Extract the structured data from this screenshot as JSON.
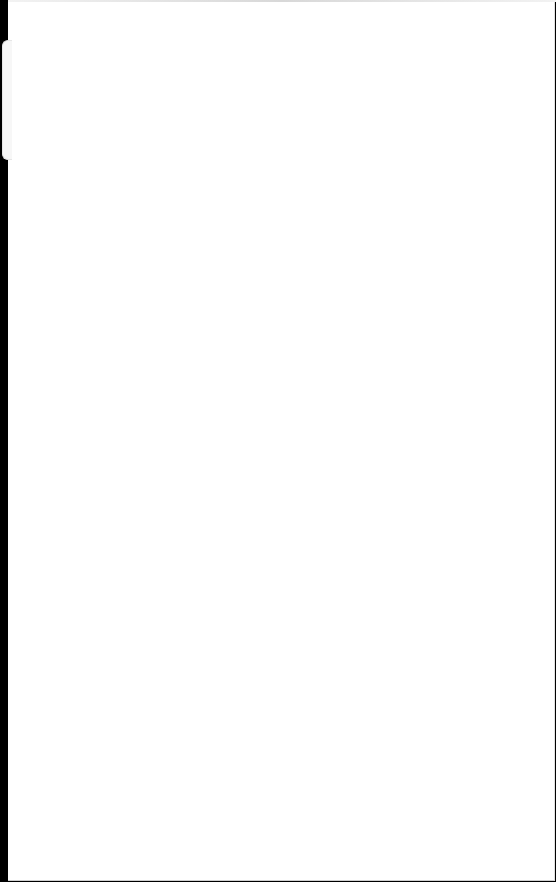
{
  "screen": {
    "background": "#ffffff",
    "left_edge_color": "#000000",
    "content": []
  }
}
